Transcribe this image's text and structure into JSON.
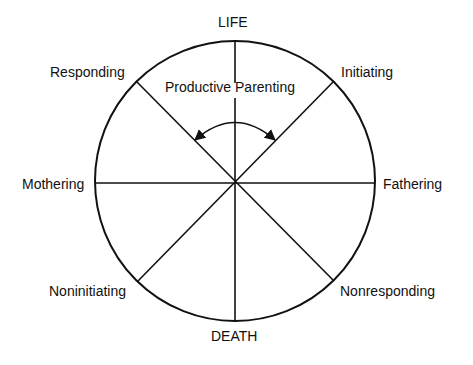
{
  "diagram": {
    "title_top": "LIFE",
    "title_bottom": "DEATH",
    "center_label": "Productive Parenting",
    "labels": {
      "upper_left": "Responding",
      "upper_right": "Initiating",
      "left": "Mothering",
      "right": "Fathering",
      "lower_left": "Noninitiating",
      "lower_right": "Nonresponding"
    },
    "colors": {
      "line": "#111111",
      "background": "#ffffff"
    }
  }
}
